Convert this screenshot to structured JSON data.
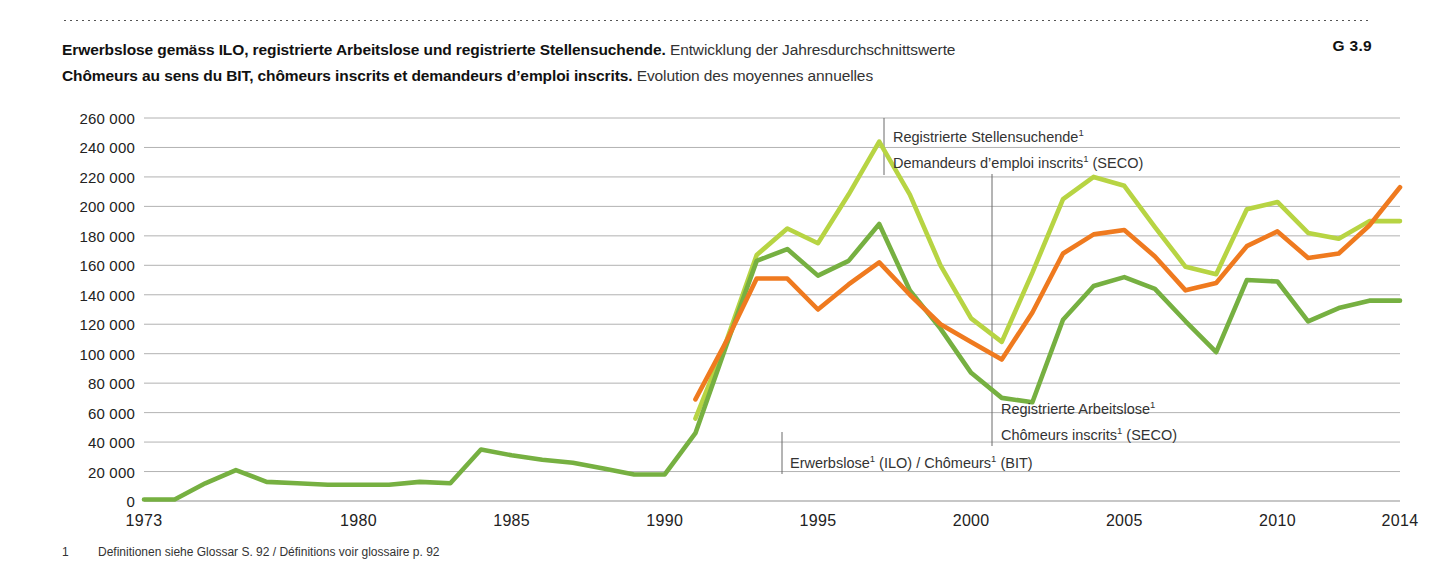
{
  "header": {
    "title_de_bold": "Erwerbslose gemäss ILO, registrierte Arbeitslose und registrierte Stellensuchende.",
    "title_de_reg": "Entwicklung der Jahresdurchschnittswerte",
    "title_fr_bold": "Chômeurs au sens du BIT, chômeurs inscrits et demandeurs d’emploi inscrits.",
    "title_fr_reg": "Evolution des moyennes annuelles",
    "figure_number": "G 3.9"
  },
  "footnote": {
    "marker": "1",
    "text": "Definitionen siehe Glossar S. 92 / Définitions voir glossaire p. 92"
  },
  "annotations": {
    "stellensuchende_line1": "Registrierte Stellensuchende",
    "stellensuchende_line1_sup": "1",
    "stellensuchende_line2a": "Demandeurs d’emploi inscrits",
    "stellensuchende_line2_sup": "1",
    "stellensuchende_line2b": " (SECO)",
    "arbeitslose_line1": "Registrierte Arbeitslose",
    "arbeitslose_line1_sup": "1",
    "arbeitslose_line2a": "Chômeurs inscrits",
    "arbeitslose_line2_sup": "1",
    "arbeitslose_line2b": " (SECO)",
    "erwerbslose_a": "Erwerbslose",
    "erwerbslose_sup1": "1",
    "erwerbslose_b": " (ILO) / Chômeurs",
    "erwerbslose_sup2": "1",
    "erwerbslose_c": " (BIT)"
  },
  "colors": {
    "stellensuchende": "#b7d443",
    "erwerbslose": "#76b041",
    "arbeitslose": "#ef7a1f",
    "grid": "#a9a9a9",
    "axis": "#8f8f8f",
    "leader": "#6b6b6b"
  },
  "chart_data": {
    "type": "line",
    "title": "Erwerbslose gemäss ILO, registrierte Arbeitslose und registrierte Stellensuchende",
    "subtitle": "Entwicklung der Jahresdurchschnittswerte / Evolution des moyennes annuelles",
    "xlabel": "",
    "ylabel": "",
    "xlim": [
      1973,
      2014
    ],
    "ylim": [
      0,
      260000
    ],
    "ytick_step": 20000,
    "yticks": [
      0,
      20000,
      40000,
      60000,
      80000,
      100000,
      120000,
      140000,
      160000,
      180000,
      200000,
      220000,
      240000,
      260000
    ],
    "ytick_labels": [
      "0",
      "20 000",
      "40 000",
      "60 000",
      "80 000",
      "100 000",
      "120 000",
      "140 000",
      "160 000",
      "180 000",
      "200 000",
      "220 000",
      "240 000",
      "260 000"
    ],
    "xticks": [
      1973,
      1980,
      1985,
      1990,
      1995,
      2000,
      2005,
      2010,
      2014
    ],
    "xtick_labels": [
      "1973",
      "1980",
      "1985",
      "1990",
      "1995",
      "2000",
      "2005",
      "2010",
      "2014"
    ],
    "grid": true,
    "legend": "inline-annotations",
    "series": [
      {
        "name": "Registrierte Stellensuchende / Demandeurs d’emploi inscrits (SECO)",
        "color": "#b7d443",
        "x": [
          1991,
          1992,
          1993,
          1994,
          1995,
          1996,
          1997,
          1998,
          1999,
          2000,
          2001,
          2002,
          2003,
          2004,
          2005,
          2006,
          2007,
          2008,
          2009,
          2010,
          2011,
          2012,
          2013,
          2014
        ],
        "values": [
          56000,
          108000,
          167000,
          185000,
          175000,
          208000,
          244000,
          208000,
          160000,
          124000,
          108000,
          155000,
          205000,
          220000,
          214000,
          186000,
          159000,
          154000,
          198000,
          203000,
          182000,
          178000,
          190000,
          190000
        ]
      },
      {
        "name": "Erwerbslose (ILO) / Chômeurs (BIT)",
        "color": "#76b041",
        "x": [
          1973,
          1974,
          1975,
          1976,
          1977,
          1978,
          1979,
          1980,
          1981,
          1982,
          1983,
          1984,
          1985,
          1986,
          1987,
          1988,
          1989,
          1990,
          1991,
          1992,
          1993,
          1994,
          1995,
          1996,
          1997,
          1998,
          1999,
          2000,
          2001,
          2002,
          2003,
          2004,
          2005,
          2006,
          2007,
          2008,
          2009,
          2010,
          2011,
          2012,
          2013,
          2014
        ],
        "values": [
          1000,
          1000,
          12000,
          21000,
          13000,
          12000,
          11000,
          11000,
          11000,
          13000,
          12000,
          35000,
          31000,
          28000,
          26000,
          22000,
          18000,
          18000,
          46000,
          105000,
          163000,
          171000,
          153000,
          163000,
          188000,
          143000,
          117000,
          87000,
          70000,
          67000,
          123000,
          146000,
          152000,
          144000,
          122000,
          101000,
          150000,
          149000,
          122000,
          131000,
          136000,
          136000
        ]
      },
      {
        "name": "Registrierte Arbeitslose / Chômeurs inscrits (SECO)",
        "color": "#ef7a1f",
        "x": [
          1991,
          1992,
          1993,
          1994,
          1995,
          1996,
          1997,
          1998,
          1999,
          2000,
          2001,
          2002,
          2003,
          2004,
          2005,
          2006,
          2007,
          2008,
          2009,
          2010,
          2011,
          2012,
          2013,
          2014
        ],
        "values": [
          69000,
          108000,
          151000,
          151000,
          130000,
          147000,
          162000,
          140000,
          120000,
          108000,
          96000,
          128000,
          168000,
          181000,
          184000,
          166000,
          143000,
          148000,
          173000,
          183000,
          165000,
          168000,
          187000,
          213000
        ]
      }
    ]
  }
}
